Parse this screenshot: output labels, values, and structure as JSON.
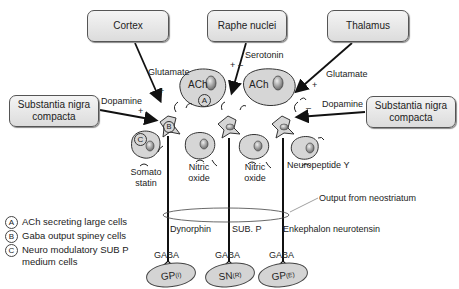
{
  "sources": {
    "cortex": "Cortex",
    "raphe": "Raphe nuclei",
    "thalamus": "Thalamus",
    "snc_left": "Substantia nigra compacta",
    "snc_right": "Substantia nigra compacta"
  },
  "transmitters": {
    "glutamate_left": "Glutamate",
    "serotonin": "Serotonin",
    "glutamate_right": "Glutamate",
    "dopamine_left": "Dopamine",
    "dopamine_right": "Dopamine"
  },
  "cells": {
    "ach_left": "ACh",
    "ach_right": "ACh",
    "marker_a": "A",
    "marker_b": "B",
    "marker_c": "C",
    "somatostatin_1": "Somato",
    "somatostatin_2": "statin",
    "nitric_oxide_left_1": "Nitric",
    "nitric_oxide_left_2": "oxide",
    "nitric_oxide_right_1": "Nitric",
    "nitric_oxide_right_2": "oxide",
    "neuropeptide_y": "Neuropeptide Y"
  },
  "outputs": {
    "neostriatum_label": "Output from neostriatum",
    "dynorphin": "Dynorphin",
    "sub_p": "SUB. P",
    "enkephalon": "Enkephalon neurotensin",
    "gaba_1": "GABA",
    "gaba_2": "GABA",
    "gaba_3": "GABA",
    "targets": [
      {
        "main": "GP",
        "sub": "(I)"
      },
      {
        "main": "SN",
        "sub": "(R)"
      },
      {
        "main": "GP",
        "sub": "(E)"
      }
    ]
  },
  "legend": [
    {
      "mark": "A",
      "text": "ACh secreting large cells"
    },
    {
      "mark": "B",
      "text": "Gaba output spiney cells"
    },
    {
      "mark": "C",
      "text": "Neuro modulatory SUB P medium cells"
    }
  ],
  "signs": {
    "plus": "+",
    "minus": "–"
  }
}
